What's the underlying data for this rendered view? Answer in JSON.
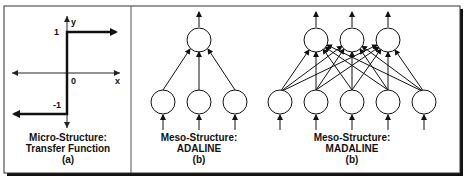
{
  "panels": [
    {
      "id": "a",
      "title_line1": "Micro-Structure:",
      "title_line2": "Transfer Function",
      "tag": "(a)",
      "axis": {
        "y_label": "y",
        "x_label": "x",
        "origin": "0",
        "pos_level": "1",
        "neg_level": "-1"
      }
    },
    {
      "id": "b1",
      "title_line1": "Meso-Structure:",
      "title_line2": "ADALINE",
      "tag": "(b)",
      "inputs": 3,
      "outputs": 1
    },
    {
      "id": "b2",
      "title_line1": "Meso-Structure:",
      "title_line2": "MADALINE",
      "tag": "(b)",
      "inputs": 5,
      "outputs": 3
    }
  ]
}
